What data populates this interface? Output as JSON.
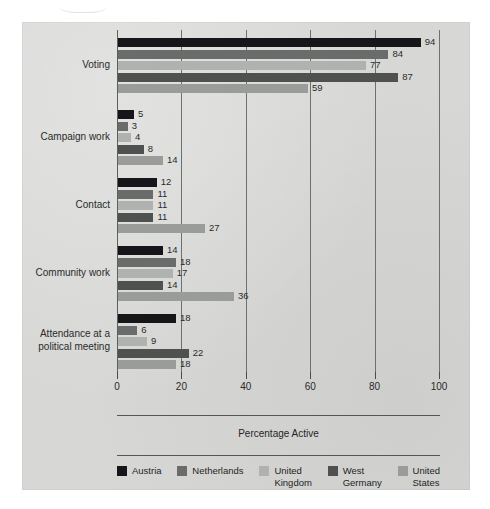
{
  "chart_data": {
    "type": "bar",
    "orientation": "horizontal",
    "title": "",
    "xlabel": "Percentage Active",
    "ylabel": "",
    "xlim": [
      0,
      100
    ],
    "xticks": [
      0,
      20,
      40,
      60,
      80,
      100
    ],
    "xtick_labels": [
      "0",
      "20",
      "40",
      "60",
      "80",
      "100"
    ],
    "grid": "vertical",
    "legend_position": "bottom",
    "categories": [
      "Voting",
      "Campaign work",
      "Contact",
      "Community work",
      "Attendance at a\npolitical meeting"
    ],
    "series": [
      {
        "name": "Austria",
        "color": "#16161a",
        "values": [
          94,
          5,
          12,
          14,
          18
        ]
      },
      {
        "name": "Netherlands",
        "color": "#6a6c6b",
        "values": [
          84,
          3,
          11,
          18,
          6
        ]
      },
      {
        "name": "United\nKingdom",
        "color": "#b0b2b0",
        "values": [
          77,
          4,
          11,
          17,
          9
        ]
      },
      {
        "name": "West\nGermany",
        "color": "#4e5150",
        "values": [
          87,
          8,
          11,
          14,
          22
        ]
      },
      {
        "name": "United\nStates",
        "color": "#9a9c9a",
        "values": [
          59,
          14,
          27,
          36,
          18
        ]
      }
    ]
  },
  "legend": {
    "items": [
      {
        "label": "Austria",
        "color": "#16161a"
      },
      {
        "label": "Netherlands",
        "color": "#6a6c6b"
      },
      {
        "label": "United\nKingdom",
        "color": "#b0b2b0"
      },
      {
        "label": "West\nGermany",
        "color": "#4e5150"
      },
      {
        "label": "United\nStates",
        "color": "#9a9c9a"
      }
    ]
  },
  "axis": {
    "x_title": "Percentage Active"
  },
  "colors": {
    "panel_background": "#d7d8d6",
    "page_background": "#ffffff",
    "gridline": "#6e706e",
    "text": "#2a2a2a"
  }
}
